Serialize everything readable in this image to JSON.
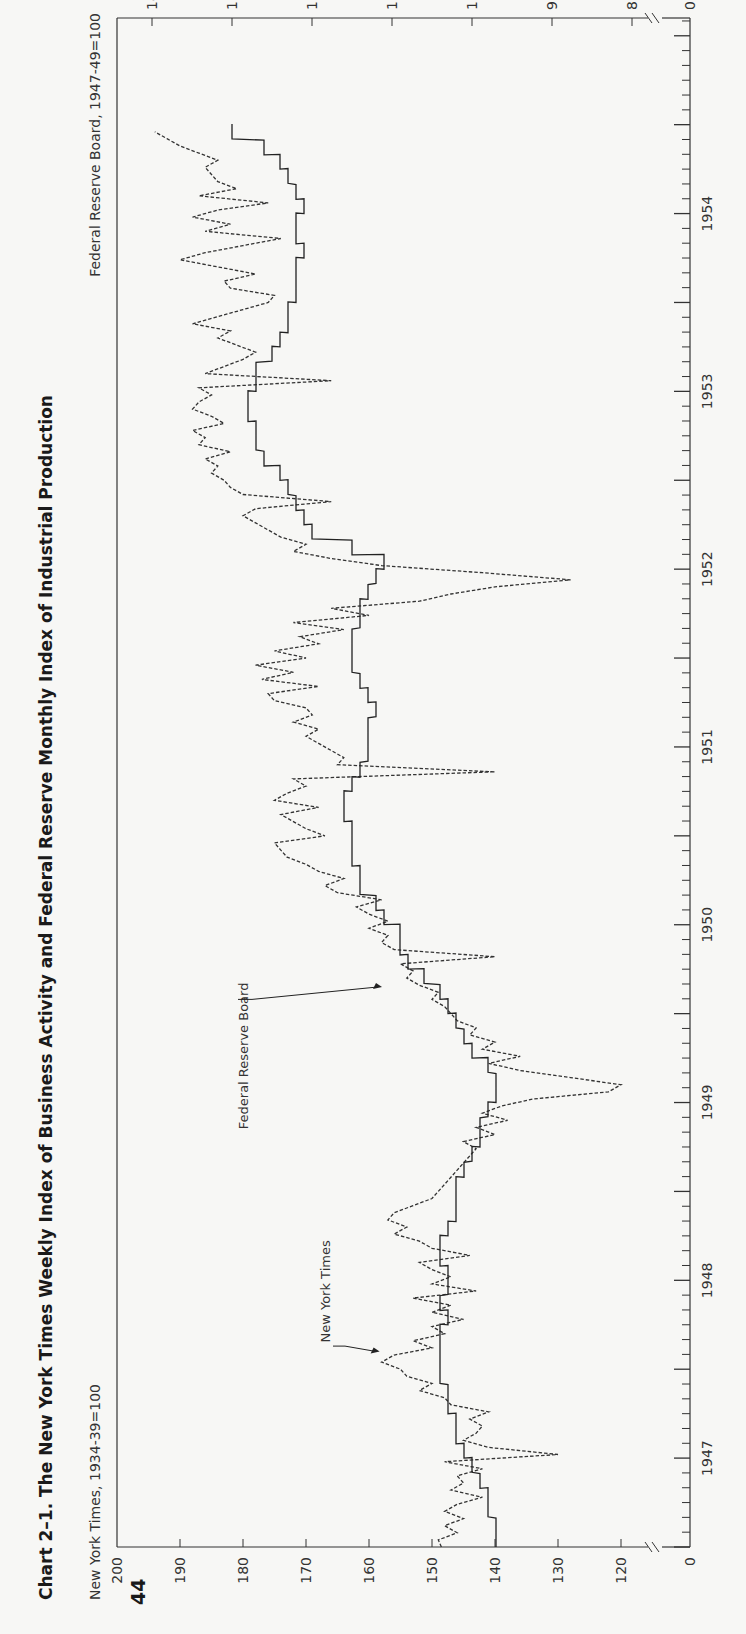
{
  "page": {
    "number": "44",
    "title": "Chart 2–1. The New York Times Weekly Index of Business Activity and Federal Reserve Monthly Index of Industrial Production"
  },
  "chart_data": {
    "type": "line",
    "title": "Chart 2–1. The New York Times Weekly Index of Business Activity and Federal Reserve Monthly Index of Industrial Production",
    "orientation": "rotated 90° counter-clockwise on the page (time runs bottom-to-top)",
    "x_axis": {
      "label": "",
      "tick_labels": [
        "1947",
        "1948",
        "1949",
        "1950",
        "1951",
        "1952",
        "1953",
        "1954"
      ],
      "range": [
        "1947-01",
        "1954-12"
      ],
      "minor_ticks": "monthly"
    },
    "left_axis": {
      "label": "New York Times, 1934-39=100",
      "tick_labels": [
        "0",
        "120",
        "130",
        "140",
        "150",
        "160",
        "170",
        "180",
        "190",
        "200"
      ],
      "range": [
        115,
        200
      ],
      "axis_break": true
    },
    "right_axis": {
      "label": "Federal Reserve Board, 1947-49=100",
      "tick_labels": [
        "0",
        "80",
        "90",
        "100",
        "110",
        "120",
        "130",
        "140"
      ],
      "range": [
        75,
        141
      ],
      "axis_break": true
    },
    "grid": false,
    "legend": "inline annotations with arrows",
    "series": [
      {
        "name": "New York Times",
        "style": "dashed",
        "frequency": "weekly",
        "axis": "left",
        "x": [
          1947.0,
          1947.04,
          1947.08,
          1947.12,
          1947.16,
          1947.2,
          1947.24,
          1947.28,
          1947.32,
          1947.36,
          1947.4,
          1947.44,
          1947.48,
          1947.52,
          1947.56,
          1947.6,
          1947.64,
          1947.68,
          1947.72,
          1947.76,
          1947.8,
          1947.84,
          1947.88,
          1947.92,
          1947.96,
          1948.0,
          1948.04,
          1948.08,
          1948.12,
          1948.16,
          1948.2,
          1948.24,
          1948.28,
          1948.32,
          1948.36,
          1948.4,
          1948.44,
          1948.48,
          1948.52,
          1948.56,
          1948.6,
          1948.64,
          1948.68,
          1948.72,
          1948.76,
          1948.8,
          1948.84,
          1948.88,
          1948.92,
          1948.96,
          1949.0,
          1949.04,
          1949.08,
          1949.12,
          1949.16,
          1949.2,
          1949.24,
          1949.28,
          1949.32,
          1949.36,
          1949.4,
          1949.44,
          1949.48,
          1949.52,
          1949.56,
          1949.6,
          1949.64,
          1949.68,
          1949.72,
          1949.76,
          1949.8,
          1949.84,
          1949.88,
          1949.92,
          1949.96,
          1950.0,
          1950.04,
          1950.08,
          1950.12,
          1950.16,
          1950.2,
          1950.24,
          1950.28,
          1950.32,
          1950.36,
          1950.4,
          1950.44,
          1950.48,
          1950.52,
          1950.56,
          1950.6,
          1950.64,
          1950.68,
          1950.72,
          1950.76,
          1950.8,
          1950.84,
          1950.88,
          1950.92,
          1950.96,
          1951.0,
          1951.04,
          1951.08,
          1951.12,
          1951.16,
          1951.2,
          1951.24,
          1951.28,
          1951.32,
          1951.36,
          1951.4,
          1951.44,
          1951.48,
          1951.52,
          1951.56,
          1951.6,
          1951.64,
          1951.68,
          1951.72,
          1951.76,
          1951.8,
          1951.84,
          1951.88,
          1951.92,
          1951.96,
          1952.0,
          1952.04,
          1952.08,
          1952.12,
          1952.16,
          1952.2,
          1952.24,
          1952.28,
          1952.32,
          1952.36,
          1952.4,
          1952.44,
          1952.48,
          1952.52,
          1952.56,
          1952.6,
          1952.64,
          1952.68,
          1952.72,
          1952.76,
          1952.8,
          1952.84,
          1952.88,
          1952.92,
          1952.96,
          1953.0,
          1953.04,
          1953.08,
          1953.12,
          1953.16,
          1953.2,
          1953.24,
          1953.28,
          1953.32,
          1953.36,
          1953.4,
          1953.44,
          1953.48,
          1953.52,
          1953.56,
          1953.6,
          1953.64,
          1953.68,
          1953.72,
          1953.76,
          1953.8,
          1953.84,
          1953.88,
          1953.92,
          1953.96,
          1954.0,
          1954.04,
          1954.08,
          1954.12,
          1954.16,
          1954.2,
          1954.24,
          1954.28,
          1954.32,
          1954.36,
          1954.4,
          1954.44,
          1954.48,
          1954.52,
          1954.56,
          1954.6,
          1954.64,
          1954.68,
          1954.72,
          1954.76,
          1954.8,
          1954.84,
          1954.88,
          1954.92,
          1954.96
        ],
        "values": [
          148.5,
          149,
          146,
          148,
          145,
          148,
          146,
          142,
          147,
          145,
          146,
          142,
          148,
          130,
          141,
          145,
          143,
          142,
          144,
          141,
          147,
          148,
          152,
          150,
          154,
          155,
          158,
          156,
          150,
          153,
          148,
          150,
          145,
          150,
          147,
          153,
          143,
          150,
          147,
          150,
          152,
          144,
          150,
          152,
          156,
          154,
          157,
          156,
          153,
          150,
          149,
          148,
          147,
          146,
          145,
          144,
          143,
          145,
          140,
          143,
          138,
          142,
          139,
          134,
          122,
          120,
          128,
          136,
          141,
          136,
          142,
          140,
          144,
          143,
          146,
          147,
          148,
          150,
          149,
          152,
          154,
          153,
          155,
          140,
          156,
          158,
          157,
          160,
          157,
          160,
          162,
          158,
          165,
          167,
          164,
          168,
          170,
          173,
          174,
          175,
          167,
          170,
          172,
          174,
          168,
          175,
          173,
          170,
          172,
          140,
          165,
          164,
          166,
          168,
          170,
          168,
          172,
          169,
          170,
          175,
          176,
          168,
          177,
          172,
          178,
          170,
          175,
          168,
          171,
          164,
          172,
          160,
          166,
          152,
          147,
          140,
          128,
          142,
          158,
          166,
          172,
          170,
          174,
          176,
          178,
          180,
          178,
          166,
          180,
          182,
          183,
          185,
          184,
          186,
          182,
          187,
          186,
          188,
          183,
          185,
          188,
          187,
          185,
          187,
          166,
          186,
          183,
          180,
          178,
          181,
          184,
          182,
          188,
          184,
          180,
          176,
          175,
          182,
          183,
          178,
          184,
          190,
          186,
          180,
          174,
          186,
          182,
          188,
          184,
          176,
          187,
          181,
          184,
          185,
          186,
          184,
          187,
          190,
          192,
          194
        ]
      },
      {
        "name": "Federal Reserve Board",
        "style": "solid step",
        "frequency": "monthly",
        "axis": "right",
        "x": [
          1947.0,
          1947.08,
          1947.17,
          1947.25,
          1947.33,
          1947.42,
          1947.5,
          1947.58,
          1947.67,
          1947.75,
          1947.83,
          1947.92,
          1948.0,
          1948.08,
          1948.17,
          1948.25,
          1948.33,
          1948.42,
          1948.5,
          1948.58,
          1948.67,
          1948.75,
          1948.83,
          1948.92,
          1949.0,
          1949.08,
          1949.17,
          1949.25,
          1949.33,
          1949.42,
          1949.5,
          1949.58,
          1949.67,
          1949.75,
          1949.83,
          1949.92,
          1950.0,
          1950.08,
          1950.17,
          1950.25,
          1950.33,
          1950.42,
          1950.5,
          1950.58,
          1950.67,
          1950.75,
          1950.83,
          1950.92,
          1951.0,
          1951.08,
          1951.17,
          1951.25,
          1951.33,
          1951.42,
          1951.5,
          1951.58,
          1951.67,
          1951.75,
          1951.83,
          1951.92,
          1952.0,
          1952.08,
          1952.17,
          1952.25,
          1952.33,
          1952.42,
          1952.5,
          1952.58,
          1952.67,
          1952.75,
          1952.83,
          1952.92,
          1953.0,
          1953.08,
          1953.17,
          1953.25,
          1953.33,
          1953.42,
          1953.5,
          1953.58,
          1953.67,
          1953.75,
          1953.83,
          1953.92,
          1954.0,
          1954.08,
          1954.17,
          1954.25,
          1954.33,
          1954.42,
          1954.5,
          1954.58,
          1954.67,
          1954.75,
          1954.83,
          1954.92
        ],
        "values": [
          97,
          97,
          98,
          98,
          99,
          100,
          101,
          102,
          102,
          103,
          103,
          104,
          104,
          104,
          104,
          103,
          104,
          103,
          103,
          104,
          104,
          103,
          102,
          102,
          102,
          101,
          100,
          99,
          99,
          98,
          97,
          97,
          98,
          100,
          101,
          102,
          103,
          104,
          106,
          108,
          109,
          109,
          111,
          112,
          114,
          114,
          115,
          115,
          115,
          116,
          116,
          115,
          114,
          113,
          113,
          113,
          112,
          113,
          114,
          115,
          115,
          115,
          114,
          114,
          113,
          112,
          111,
          115,
          120,
          121,
          122,
          123,
          124,
          126,
          127,
          127,
          128,
          128,
          127,
          127,
          125,
          124,
          123,
          123,
          122,
          122,
          122,
          121,
          122,
          122,
          121,
          122,
          123,
          124,
          126,
          130
        ]
      }
    ],
    "annotations": [
      {
        "text": "New York Times",
        "points_to": "dashed weekly series, early 1948"
      },
      {
        "text": "Federal Reserve Board",
        "points_to": "solid step series, early 1950"
      }
    ]
  }
}
